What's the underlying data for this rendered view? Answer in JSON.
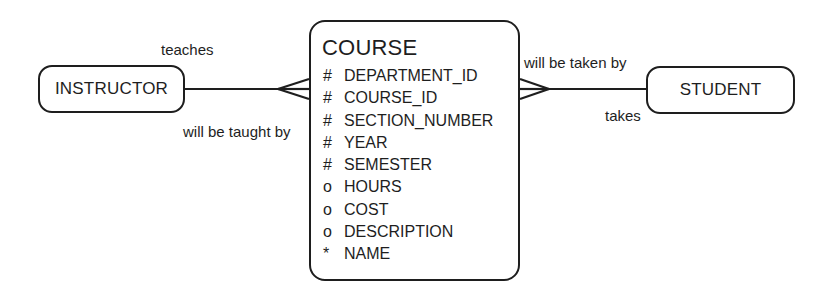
{
  "diagram": {
    "type": "entity-relationship",
    "notation": "crows-foot",
    "colors": {
      "stroke": "#1e1e1e",
      "background": "#ffffff",
      "text": "#1e1e1e"
    },
    "entities": {
      "instructor": {
        "name": "INSTRUCTOR"
      },
      "student": {
        "name": "STUDENT"
      },
      "course": {
        "name": "COURSE",
        "attributes": [
          {
            "symbol": "#",
            "name": "DEPARTMENT_ID",
            "kind": "unique-identifier"
          },
          {
            "symbol": "#",
            "name": "COURSE_ID",
            "kind": "unique-identifier"
          },
          {
            "symbol": "#",
            "name": "SECTION_NUMBER",
            "kind": "unique-identifier"
          },
          {
            "symbol": "#",
            "name": "YEAR",
            "kind": "unique-identifier"
          },
          {
            "symbol": "#",
            "name": "SEMESTER",
            "kind": "unique-identifier"
          },
          {
            "symbol": "o",
            "name": "HOURS",
            "kind": "optional"
          },
          {
            "symbol": "o",
            "name": "COST",
            "kind": "optional"
          },
          {
            "symbol": "o",
            "name": "DESCRIPTION",
            "kind": "optional"
          },
          {
            "symbol": "*",
            "name": "NAME",
            "kind": "mandatory"
          }
        ]
      }
    },
    "relationships": [
      {
        "from": "INSTRUCTOR",
        "to": "COURSE",
        "label_from": "teaches",
        "label_to": "will be taught by",
        "cardinality_at_course": "many"
      },
      {
        "from": "COURSE",
        "to": "STUDENT",
        "label_from": "will be taken by",
        "label_to": "takes",
        "cardinality_at_course": "many"
      }
    ]
  }
}
